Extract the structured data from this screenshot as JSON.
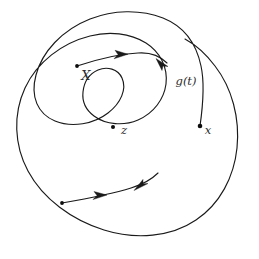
{
  "figure": {
    "type": "mathematical-diagram",
    "background_color": "#ffffff",
    "stroke_color": "#1a1a1a",
    "label_color": "#2b2b2b",
    "width": 259,
    "height": 259
  },
  "labels": {
    "region": "X",
    "curve": "g(t)",
    "interior_point": "z",
    "boundary_point": "x"
  },
  "label_positions": {
    "region": {
      "x": 86,
      "y": 76
    },
    "curve": {
      "x": 186,
      "y": 82
    },
    "interior_point": {
      "x": 124,
      "y": 131
    },
    "boundary_point": {
      "x": 208,
      "y": 131
    }
  },
  "points": [
    {
      "name": "z",
      "x": 113,
      "y": 127,
      "radius": 2.0,
      "on_boundary": false
    },
    {
      "name": "x",
      "x": 200,
      "y": 126,
      "radius": 2.3,
      "on_boundary": true
    },
    {
      "name": "path-upper-start",
      "x": 77,
      "y": 66,
      "radius": 1.9,
      "on_boundary": false
    },
    {
      "name": "path-lower-start",
      "x": 62,
      "y": 203,
      "radius": 1.9,
      "on_boundary": false
    }
  ],
  "arrowheads": [
    {
      "name": "upper-path-arrow",
      "x": 122,
      "y": 56,
      "direction": "right"
    },
    {
      "name": "g-curve-arrow",
      "x": 162,
      "y": 63,
      "direction": "upper-left"
    },
    {
      "name": "lower-path-arrow",
      "x": 101,
      "y": 193,
      "direction": "right"
    },
    {
      "name": "inner-curve-arrow",
      "x": 141,
      "y": 188,
      "direction": "lower-left"
    }
  ],
  "geometry": {
    "boundary_outer": "M 200 126 C 206 96 208 66 196 44 C 183 20 155 10 126 11 C 92 12 58 26 41 50 C 28 68 26 92 36 108 C 46 124 66 130 84 126 C 100 122 112 110 116 98 C 120 86 116 74 106 70",
    "note": "Boundary is a single closed spiral-hook curve rendered as one path in the SVG markup."
  }
}
